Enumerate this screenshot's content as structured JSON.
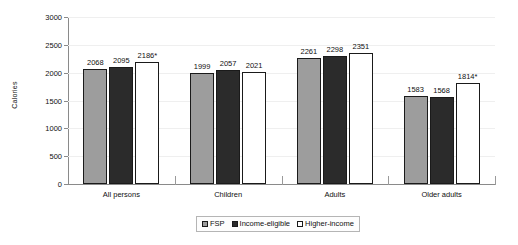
{
  "chart_data": {
    "type": "bar",
    "title": "",
    "xlabel": "",
    "ylabel": "Calories",
    "ylim": [
      0,
      3000
    ],
    "ytick_step": 500,
    "yticks": [
      "0",
      "500",
      "1000",
      "1500",
      "2000",
      "2500",
      "3000"
    ],
    "grid": true,
    "legend_position": "bottom-center",
    "categories": [
      "All persons",
      "Children",
      "Adults",
      "Older adults"
    ],
    "series": [
      {
        "name": "FSP",
        "color": "#9d9d9d",
        "values": [
          2068,
          1999,
          2261,
          1583
        ],
        "labels": [
          "2068",
          "1999",
          "2261",
          "1583"
        ]
      },
      {
        "name": "Income-eligible",
        "color": "#2b2b2b",
        "values": [
          2095,
          2057,
          2298,
          1568
        ],
        "labels": [
          "2095",
          "2057",
          "2298",
          "1568"
        ]
      },
      {
        "name": "Higher-income",
        "color": "#ffffff",
        "values": [
          2186,
          2021,
          2351,
          1814
        ],
        "labels": [
          "2186*",
          "2021",
          "2351",
          "1814*"
        ]
      }
    ]
  }
}
